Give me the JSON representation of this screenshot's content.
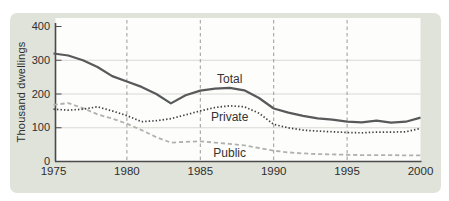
{
  "chart_data": {
    "type": "line",
    "title": "",
    "xlabel": "",
    "ylabel": "Thousand dwellings",
    "xlim": [
      1975,
      2000
    ],
    "ylim": [
      0,
      400
    ],
    "grid": "horizontal light solid at 100/200/300, vertical dashed at 5-year intervals",
    "x_start": 1975,
    "years": [
      1975,
      1976,
      1977,
      1978,
      1979,
      1980,
      1981,
      1982,
      1983,
      1984,
      1985,
      1986,
      1987,
      1988,
      1989,
      1990,
      1991,
      1992,
      1993,
      1994,
      1995,
      1996,
      1997,
      1998,
      1999,
      2000
    ],
    "x_tick_labels": [
      "1975",
      "1980",
      "1985",
      "1990",
      "1995",
      "2000"
    ],
    "x_tick_values": [
      1975,
      1980,
      1985,
      1990,
      1995,
      2000
    ],
    "y_tick_labels": [
      "400",
      "300",
      "200",
      "100",
      "0"
    ],
    "y_tick_values": [
      400,
      300,
      200,
      100,
      0
    ],
    "grid_vertical_years": [
      1980,
      1985,
      1990,
      1995
    ],
    "grid_horizontal_values": [
      100,
      200,
      300
    ],
    "series": [
      {
        "name": "Total",
        "style": "solid",
        "color": "#58595b",
        "width": 2.2,
        "values": [
          320,
          314,
          300,
          280,
          253,
          237,
          221,
          200,
          172,
          196,
          210,
          216,
          218,
          211,
          188,
          157,
          145,
          135,
          128,
          124,
          118,
          116,
          121,
          115,
          118,
          130
        ]
      },
      {
        "name": "Private",
        "style": "dotted",
        "color": "#3f3f41",
        "width": 1.7,
        "values": [
          155,
          152,
          155,
          162,
          150,
          136,
          118,
          121,
          127,
          138,
          150,
          160,
          165,
          162,
          143,
          110,
          100,
          93,
          90,
          88,
          86,
          85,
          87,
          87,
          88,
          98
        ]
      },
      {
        "name": "Public",
        "style": "dashed",
        "color": "#b1b1ae",
        "width": 1.8,
        "values": [
          168,
          173,
          158,
          140,
          127,
          112,
          93,
          72,
          56,
          58,
          60,
          56,
          52,
          48,
          40,
          32,
          27,
          24,
          22,
          21,
          20,
          19,
          19,
          19,
          18,
          18
        ]
      }
    ],
    "annotations": [
      {
        "series": "Total",
        "year": 1987,
        "value": 246
      },
      {
        "series": "Private",
        "year": 1987,
        "value": 131
      },
      {
        "series": "Public",
        "year": 1987,
        "value": 24
      }
    ],
    "legend_position": "inline labels next to lines",
    "colors": {
      "card_bg": "#e0e3da",
      "plot_bg": "#fdfdfc",
      "axis": "#4a4a4a",
      "text": "#2e2e2e",
      "h_grid": "#d8d8d4",
      "v_grid": "#9b9b9b"
    }
  }
}
